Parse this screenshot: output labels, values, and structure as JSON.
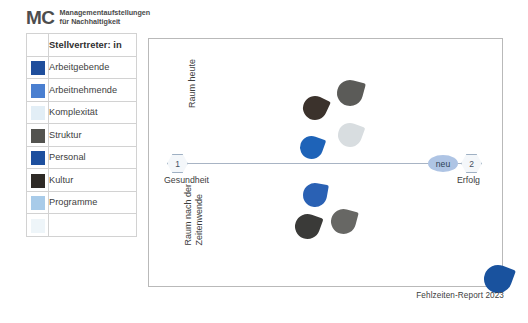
{
  "brand": {
    "mark": "MC",
    "line1": "Managementaufstellungen",
    "line2": "für Nachhaltigkeit"
  },
  "legend": {
    "header_swatch": "",
    "header_label": "Stellvertreter: in",
    "rows": [
      {
        "label": "Arbeitgebende",
        "color": "#1f4e9c"
      },
      {
        "label": "Arbeitnehmende",
        "color": "#4a7fd0"
      },
      {
        "label": "Komplexität",
        "color": "#e2eef6"
      },
      {
        "label": "Struktur",
        "color": "#53534f"
      },
      {
        "label": "Personal",
        "color": "#1d4f9e"
      },
      {
        "label": "Kultur",
        "color": "#2e2a26"
      },
      {
        "label": "Programme",
        "color": "#a8cbe9"
      },
      {
        "label": "",
        "color": "#eef5f9"
      }
    ]
  },
  "chart_data": {
    "type": "scatter",
    "title": "",
    "xlabel": "",
    "ylabel": "",
    "axis": {
      "left_marker": "1",
      "right_marker": "2",
      "left_label": "Gesundheit",
      "right_label": "Erfolg",
      "mid_badge": "neu",
      "upper_region": "Raum heute",
      "lower_region": "Raum nach der\nZeitenwende",
      "grid": false,
      "legend_position": "left-outside"
    },
    "regions": [
      {
        "name": "Raum heute",
        "label_line1": "Raum heute",
        "label_line2": ""
      },
      {
        "name": "Raum nach der Zeitenwende",
        "label_line1": "Raum nach der",
        "label_line2": "Zeitenwende"
      }
    ],
    "points": [
      {
        "series": "Kultur",
        "region": "Raum heute",
        "x": 0.47,
        "y": 0.28,
        "color": "#3b322c",
        "size": 24,
        "rotation": 205
      },
      {
        "series": "Struktur",
        "region": "Raum heute",
        "x": 0.57,
        "y": 0.22,
        "color": "#5b5b58",
        "size": 26,
        "rotation": 195
      },
      {
        "series": "Komplexität",
        "region": "Raum heute",
        "x": 0.57,
        "y": 0.39,
        "color": "#d8dde0",
        "size": 24,
        "rotation": 200
      },
      {
        "series": "Arbeitgebende",
        "region": "Raum heute",
        "x": 0.46,
        "y": 0.44,
        "color": "#1e63b8",
        "size": 23,
        "rotation": 200
      },
      {
        "series": "Arbeitnehmende",
        "region": "Raum nach der Zeitenwende",
        "x": 0.47,
        "y": 0.63,
        "color": "#2a61b4",
        "size": 24,
        "rotation": 190
      },
      {
        "series": "Kultur",
        "region": "Raum nach der Zeitenwende",
        "x": 0.45,
        "y": 0.76,
        "color": "#3a3a38",
        "size": 25,
        "rotation": 200
      },
      {
        "series": "Struktur",
        "region": "Raum nach der Zeitenwende",
        "x": 0.55,
        "y": 0.74,
        "color": "#676764",
        "size": 25,
        "rotation": 195
      },
      {
        "series": "Arbeitgebende",
        "region": "corner",
        "x": 0.99,
        "y": 0.97,
        "color": "#19529e",
        "size": 28,
        "rotation": 200
      }
    ]
  },
  "footer": {
    "source": "Fehlzeiten-Report 2023"
  }
}
